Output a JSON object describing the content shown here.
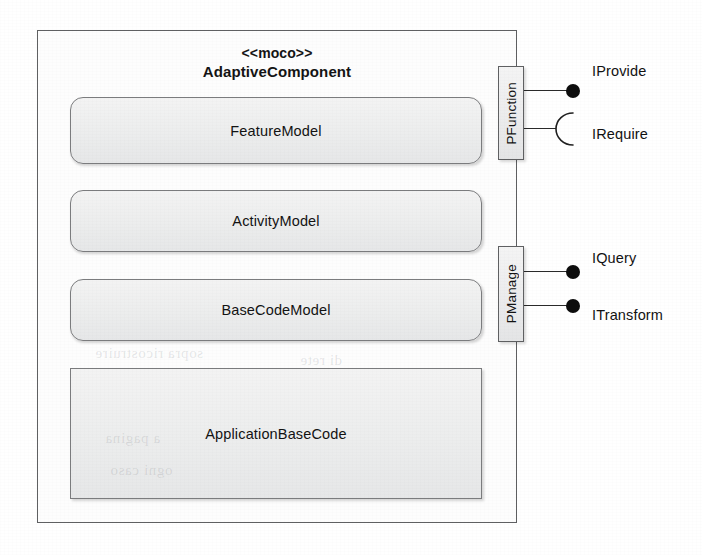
{
  "diagram": {
    "component": {
      "stereotype": "<<moco>>",
      "name": "AdaptiveComponent"
    },
    "inner_boxes": [
      {
        "label": "FeatureModel",
        "shape": "rounded"
      },
      {
        "label": "ActivityModel",
        "shape": "rounded"
      },
      {
        "label": "BaseCodeModel",
        "shape": "rounded"
      },
      {
        "label": "ApplicationBaseCode",
        "shape": "square"
      }
    ],
    "ports": [
      {
        "label": "PFunction"
      },
      {
        "label": "PManage"
      }
    ],
    "interfaces": [
      {
        "label": "IProvide",
        "kind": "provided",
        "icon": "ball-icon",
        "port": "PFunction"
      },
      {
        "label": "IRequire",
        "kind": "required",
        "icon": "socket-icon",
        "port": "PFunction"
      },
      {
        "label": "IQuery",
        "kind": "provided",
        "icon": "ball-icon",
        "port": "PManage"
      },
      {
        "label": "ITransform",
        "kind": "provided",
        "icon": "ball-icon",
        "port": "PManage"
      }
    ],
    "colors": {
      "outline": "#5f6062",
      "box_fill": "#ecedee",
      "symbol": "#0d0d0d",
      "text": "#131313",
      "page": "#ffffff"
    },
    "bleed_through": [
      "sopra ricostruire",
      "di rete",
      "a pagina",
      "ogni caso"
    ]
  }
}
